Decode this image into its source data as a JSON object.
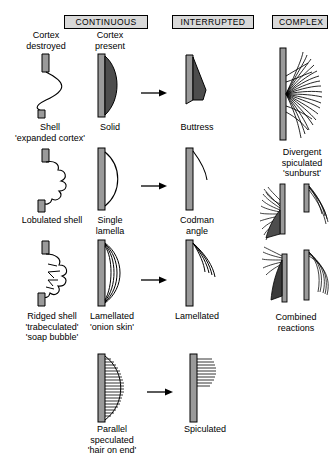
{
  "diagram": {
    "columns": [
      {
        "id": "continuous",
        "label": "CONTINUOUS"
      },
      {
        "id": "interrupted",
        "label": "INTERRUPTED"
      },
      {
        "id": "complex",
        "label": "COMPLEX"
      }
    ],
    "subheads": [
      {
        "id": "cortex-destroyed",
        "label": "Cortex\ndestroyed"
      },
      {
        "id": "cortex-present",
        "label": "Cortex\npresent"
      }
    ],
    "figures": [
      {
        "id": "shell",
        "caption": "Shell\n'expanded cortex'",
        "column": "continuous",
        "group": "cortex-destroyed",
        "row": 1
      },
      {
        "id": "solid",
        "caption": "Solid",
        "column": "continuous",
        "group": "cortex-present",
        "row": 1
      },
      {
        "id": "buttress",
        "caption": "Buttress",
        "column": "interrupted",
        "row": 1
      },
      {
        "id": "sunburst",
        "caption": "Divergent\nspiculated\n'sunburst'",
        "column": "complex",
        "row": 1
      },
      {
        "id": "lobulated-shell",
        "caption": "Lobulated shell",
        "column": "continuous",
        "group": "cortex-destroyed",
        "row": 2
      },
      {
        "id": "single-lamella",
        "caption": "Single\nlamella",
        "column": "continuous",
        "group": "cortex-present",
        "row": 2
      },
      {
        "id": "codman-angle",
        "caption": "Codman\nangle",
        "column": "interrupted",
        "row": 2
      },
      {
        "id": "ridged-shell",
        "caption": "Ridged shell\n'trabeculated'\n'soap bubble'",
        "column": "continuous",
        "group": "cortex-destroyed",
        "row": 3
      },
      {
        "id": "lamellated-onion-skin",
        "caption": "Lamellated\n'onion skin'",
        "column": "continuous",
        "group": "cortex-present",
        "row": 3
      },
      {
        "id": "lamellated",
        "caption": "Lamellated",
        "column": "interrupted",
        "row": 3
      },
      {
        "id": "combined-reactions",
        "caption": "Combined\nreactions",
        "column": "complex",
        "row": 3
      },
      {
        "id": "parallel-speculated",
        "caption": "Parallel\nspeculated\n'hair on end'",
        "column": "continuous",
        "group": "cortex-present",
        "row": 4
      },
      {
        "id": "spiculated",
        "caption": "Spiculated",
        "column": "interrupted",
        "row": 4
      }
    ],
    "arrows": [
      {
        "id": "arrow-solid-to-buttress",
        "from": "solid",
        "to": "buttress"
      },
      {
        "id": "arrow-lamella-to-codman",
        "from": "single-lamella",
        "to": "codman-angle"
      },
      {
        "id": "arrow-onionskin-to-lamellated",
        "from": "lamellated-onion-skin",
        "to": "lamellated"
      },
      {
        "id": "arrow-parallel-to-spiculated",
        "from": "parallel-speculated",
        "to": "spiculated"
      }
    ],
    "colors": {
      "header_fill": "#d9d9d9",
      "cortex_fill": "#9a9a9a",
      "reaction_fill": "#4d4d4d",
      "line": "#000000",
      "background": "#ffffff"
    }
  }
}
